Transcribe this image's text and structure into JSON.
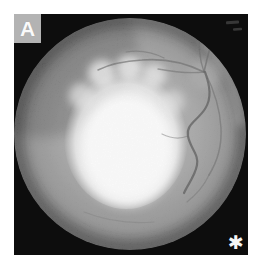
{
  "figure": {
    "panel_label": "A",
    "marker": "✱"
  },
  "colors": {
    "page_background": "#ffffff",
    "photo_frame": "#0d0d0d",
    "retina_gray": "#a2a2a2",
    "lesion_white": "#ffffff",
    "panel_label_bg": "#b3b3b3",
    "panel_label_text": "#fafafa",
    "marker_color": "#f5f5f5"
  }
}
